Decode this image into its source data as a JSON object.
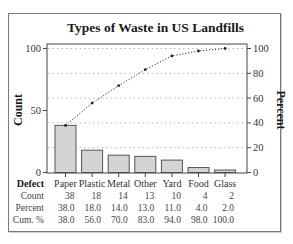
{
  "chart_data": {
    "type": "bar",
    "subtype": "pareto",
    "title": "Types of Waste in US Landfills",
    "xlabel": "Defect",
    "ylabel": "Count",
    "y2label": "Percent",
    "categories": [
      "Paper",
      "Plastic",
      "Metal",
      "Other",
      "Yard",
      "Food",
      "Glass"
    ],
    "series": [
      {
        "name": "Count",
        "type": "bar",
        "values": [
          38,
          18,
          14,
          13,
          10,
          4,
          2
        ]
      },
      {
        "name": "Cum. %",
        "type": "line",
        "axis": "right",
        "values": [
          38.0,
          56.0,
          70.0,
          83.0,
          94.0,
          98.0,
          100.0
        ]
      }
    ],
    "percent": [
      38.0,
      18.0,
      14.0,
      13.0,
      11.0,
      4.0,
      2.0
    ],
    "ylim": [
      0,
      100
    ],
    "y2lim": [
      0,
      100
    ],
    "yticks": [
      0,
      50,
      100
    ],
    "y2ticks": [
      0,
      20,
      40,
      60,
      80,
      100
    ],
    "grid": {
      "horizontal": true,
      "style": "dotted",
      "at": [
        20,
        40,
        60,
        80,
        100
      ]
    },
    "table": {
      "header_label": "Defect",
      "rows": [
        {
          "label": "Count",
          "values": [
            "38",
            "18",
            "14",
            "13",
            "10",
            "4",
            "2"
          ]
        },
        {
          "label": "Percent",
          "values": [
            "38.0",
            "18.0",
            "14.0",
            "13.0",
            "11.0",
            "4.0",
            "2.0"
          ]
        },
        {
          "label": "Cum. %",
          "values": [
            "38.0",
            "56.0",
            "70.0",
            "83.0",
            "94.0",
            "98.0",
            "100.0"
          ]
        }
      ]
    },
    "colors": {
      "bar_fill": "#d4d4d4",
      "bar_stroke": "#555555",
      "line": "#333333",
      "grid": "#b8b8b8",
      "axis": "#444444"
    }
  }
}
